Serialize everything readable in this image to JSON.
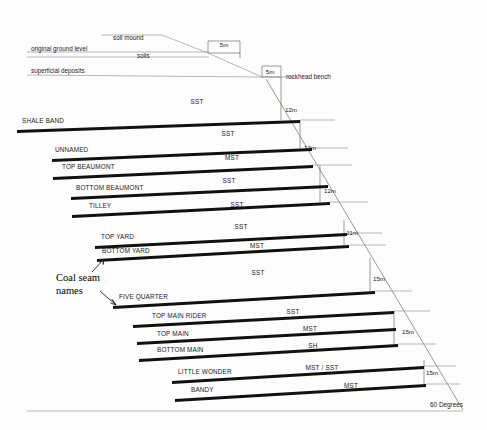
{
  "diagram": {
    "background_color": "#fdfdfd",
    "seam_color": "#111111",
    "line_color": "#9a9a9a",
    "slope_angle_label": "60 Degrees"
  },
  "surface": {
    "soil_mound_label": "soil mound",
    "original_ground_level_label": "original ground level",
    "soils_label": "soils",
    "superficial_deposits_label": "superficial deposits",
    "rockhead_bench_label": "rockhead bench"
  },
  "annotation": {
    "line1": "Coal seam",
    "line2": "names"
  },
  "bench_dimensions": [
    {
      "label": "5m",
      "x": 224,
      "y": 47
    },
    {
      "label": "5m",
      "x": 270,
      "y": 74
    },
    {
      "label": "12m",
      "x": 291,
      "y": 112
    },
    {
      "label": "13m",
      "x": 310,
      "y": 150
    },
    {
      "label": "12m",
      "x": 330,
      "y": 193
    },
    {
      "label": "11m",
      "x": 352,
      "y": 235
    },
    {
      "label": "15m",
      "x": 379,
      "y": 281
    },
    {
      "label": "15m",
      "x": 408,
      "y": 334
    },
    {
      "label": "15m",
      "x": 432,
      "y": 375
    }
  ],
  "lithologies": [
    {
      "code": "SST",
      "x": 197,
      "y": 104
    },
    {
      "code": "SST",
      "x": 228,
      "y": 136
    },
    {
      "code": "MST",
      "x": 232,
      "y": 160
    },
    {
      "code": "SST",
      "x": 229,
      "y": 183
    },
    {
      "code": "SST",
      "x": 237,
      "y": 207
    },
    {
      "code": "SST",
      "x": 241,
      "y": 229
    },
    {
      "code": "MST",
      "x": 257,
      "y": 248
    },
    {
      "code": "SST",
      "x": 258,
      "y": 275
    },
    {
      "code": "SST",
      "x": 293,
      "y": 314
    },
    {
      "code": "MST",
      "x": 310,
      "y": 331
    },
    {
      "code": "SH",
      "x": 313,
      "y": 348
    },
    {
      "code": "MST / SST",
      "x": 322,
      "y": 370
    },
    {
      "code": "MST",
      "x": 351,
      "y": 388
    }
  ],
  "seams": [
    {
      "name": "SHALE BAND",
      "label_x": 22,
      "label_y": 123,
      "x1": 17,
      "y1": 130,
      "x2": 300,
      "y2": 120
    },
    {
      "name": "UNNAMED",
      "label_x": 55,
      "label_y": 152,
      "x1": 52,
      "y1": 159,
      "x2": 312,
      "y2": 148
    },
    {
      "name": "TOP BEAUMONT",
      "label_x": 62,
      "label_y": 169,
      "x1": 53,
      "y1": 177,
      "x2": 313,
      "y2": 165
    },
    {
      "name": "BOTTOM BEAUMONT",
      "label_x": 76,
      "label_y": 190,
      "x1": 71,
      "y1": 197,
      "x2": 328,
      "y2": 185
    },
    {
      "name": "TILLEY",
      "label_x": 89,
      "label_y": 208,
      "x1": 72,
      "y1": 215,
      "x2": 330,
      "y2": 202
    },
    {
      "name": "TOP YARD",
      "label_x": 101,
      "label_y": 239,
      "x1": 95,
      "y1": 246,
      "x2": 347,
      "y2": 233
    },
    {
      "name": "BOTTOM YARD",
      "label_x": 102,
      "label_y": 253,
      "x1": 97,
      "y1": 259,
      "x2": 349,
      "y2": 245
    },
    {
      "name": "FIVE QUARTER",
      "label_x": 119,
      "label_y": 299,
      "x1": 113,
      "y1": 306,
      "x2": 375,
      "y2": 291
    },
    {
      "name": "TOP MAIN RIDER",
      "label_x": 152,
      "label_y": 318,
      "x1": 133,
      "y1": 325,
      "x2": 394,
      "y2": 311
    },
    {
      "name": "TOP MAIN",
      "label_x": 157,
      "label_y": 336,
      "x1": 137,
      "y1": 342,
      "x2": 396,
      "y2": 328
    },
    {
      "name": "BOTTOM MAIN",
      "label_x": 157,
      "label_y": 352,
      "x1": 139,
      "y1": 359,
      "x2": 398,
      "y2": 344
    },
    {
      "name": "LITTLE WONDER",
      "label_x": 178,
      "label_y": 374,
      "x1": 172,
      "y1": 381,
      "x2": 424,
      "y2": 366
    },
    {
      "name": "BANDY",
      "label_x": 191,
      "label_y": 392,
      "x1": 175,
      "y1": 399,
      "x2": 426,
      "y2": 384
    }
  ]
}
